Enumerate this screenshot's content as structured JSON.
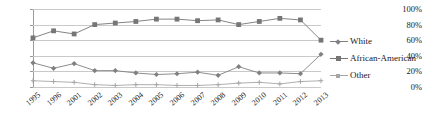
{
  "chart_data": {
    "type": "line",
    "title": "",
    "xlabel": "",
    "ylabel": "",
    "ylim": [
      0,
      100
    ],
    "ytick_labels": [
      "100%",
      "80%",
      "60%",
      "40%",
      "20%",
      "0%"
    ],
    "ytick_values": [
      100,
      80,
      60,
      40,
      20,
      0
    ],
    "grid": true,
    "legend_position": "right",
    "categories": [
      "1995",
      "1996",
      "2001",
      "2002",
      "2003",
      "2004",
      "2005",
      "2006",
      "2007",
      "2008",
      "2009",
      "2010",
      "2011",
      "2012",
      "2013"
    ],
    "series": [
      {
        "name": "White",
        "marker": "diamond",
        "color": "#808080",
        "values": [
          31,
          24,
          30,
          21,
          21,
          18,
          16,
          17,
          19,
          15,
          26,
          18,
          18,
          17,
          42
        ]
      },
      {
        "name": "African-American",
        "marker": "square",
        "color": "#767676",
        "values": [
          63,
          72,
          68,
          80,
          82,
          84,
          87,
          87,
          85,
          86,
          80,
          84,
          88,
          86,
          60
        ]
      },
      {
        "name": "Other",
        "marker": "cross",
        "color": "#a6a6a6",
        "values": [
          8,
          7,
          6,
          3,
          2,
          3,
          3,
          2,
          2,
          3,
          5,
          6,
          4,
          7,
          8
        ]
      }
    ]
  },
  "legend": {
    "items": [
      {
        "label": "White"
      },
      {
        "label": "African-American"
      },
      {
        "label": "Other"
      }
    ]
  },
  "colors": {
    "grid": "#c9c9c9",
    "axis": "#9a9a9a",
    "text": "#1a1a1a",
    "background": "#ffffff"
  }
}
